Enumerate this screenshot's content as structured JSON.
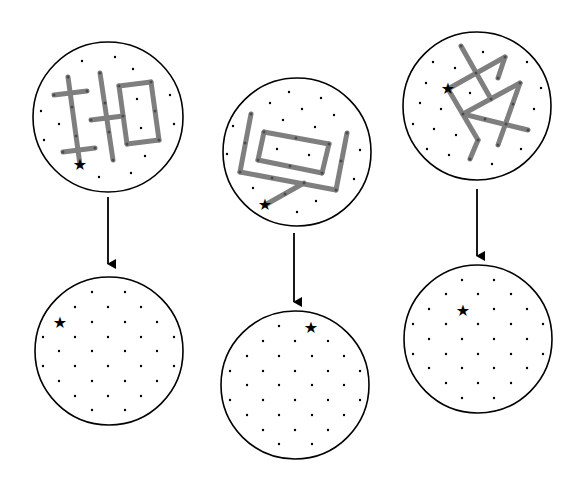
{
  "diagram": {
    "colors": {
      "stroke": "#000000",
      "figure": "#808080",
      "dot": "#000000",
      "background": "#ffffff"
    },
    "panels": [
      {
        "id": "left",
        "top": {
          "cx": 108,
          "cy": 117,
          "r": 75,
          "star": [
            80,
            165
          ],
          "figure_segments": [
            [
              [
                68,
                94
              ],
              [
                85,
                91
              ]
            ],
            [
              [
                85,
                91
              ],
              [
                87,
                91
              ]
            ],
            [
              [
                87,
                91
              ],
              [
                87,
                91
              ]
            ],
            [
              [
                68,
                94
              ],
              [
                90,
                90
              ]
            ],
            [
              [
                90,
                90
              ],
              [
                87,
                91
              ]
            ],
            [
              [
                68,
                93
              ],
              [
                87,
                91
              ]
            ],
            [
              [
                68,
                94
              ],
              [
                87,
                91
              ]
            ],
            [
              [
                68,
                94
              ],
              [
                87,
                91
              ]
            ]
          ]
        },
        "arrow": {
          "x": 108,
          "y1": 197,
          "y2": 265
        },
        "bottom": {
          "cx": 109,
          "cy": 351,
          "r": 74,
          "star": [
            60,
            322
          ]
        }
      },
      {
        "id": "middle",
        "top": {
          "cx": 297,
          "cy": 152,
          "r": 74,
          "star": [
            265,
            205
          ]
        },
        "arrow": {
          "x": 294,
          "y1": 233,
          "y2": 303
        },
        "bottom": {
          "cx": 295,
          "cy": 385,
          "r": 74,
          "star": [
            311,
            327
          ]
        }
      },
      {
        "id": "right",
        "top": {
          "cx": 477,
          "cy": 106,
          "r": 74,
          "star": [
            448,
            89
          ]
        },
        "arrow": {
          "x": 477,
          "y1": 189,
          "y2": 257
        },
        "bottom": {
          "cx": 478,
          "cy": 339,
          "r": 74,
          "star": [
            463,
            310
          ]
        }
      }
    ]
  }
}
